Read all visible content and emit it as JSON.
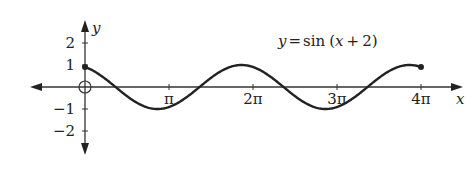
{
  "chart_data": {
    "type": "line",
    "title": "",
    "function_label": "y = sin (x + 2)",
    "function_label_parts": {
      "y": "y",
      "eq": "=",
      "fn": "sin",
      "arg_open": "(",
      "x": "x",
      "plus": "+",
      "c": "2",
      "arg_close": ")"
    },
    "xlabel": "x",
    "ylabel": "y",
    "xlim": [
      0,
      12.566
    ],
    "ylim": [
      -2,
      2
    ],
    "x_ticks": [
      {
        "value": 3.1416,
        "label": "π"
      },
      {
        "value": 6.2832,
        "label": "2π"
      },
      {
        "value": 9.4248,
        "label": "3π"
      },
      {
        "value": 12.5664,
        "label": "4π"
      }
    ],
    "y_ticks": [
      {
        "value": 2,
        "label": "2"
      },
      {
        "value": 1,
        "label": "1"
      },
      {
        "value": -1,
        "label": "−1"
      },
      {
        "value": -2,
        "label": "−2"
      }
    ],
    "series": [
      {
        "name": "y = sin(x+2)",
        "domain": [
          0,
          12.566
        ],
        "start_point": {
          "x": 0,
          "y": 0.909,
          "filled": true
        },
        "end_point": {
          "x": 12.566,
          "y": 0.909,
          "filled": true
        },
        "x": [
          0,
          1.0,
          2.0,
          3.0,
          4.0,
          5.0,
          6.0,
          7.0,
          8.0,
          9.0,
          10.0,
          11.0,
          12.0,
          12.566
        ],
        "values": [
          0.909,
          0.141,
          -0.757,
          -0.959,
          -0.279,
          0.657,
          0.989,
          0.412,
          -0.544,
          -1.0,
          -0.537,
          0.42,
          0.991,
          0.909
        ]
      }
    ],
    "origin_marker": "open-circle",
    "grid": false,
    "legend": "none"
  },
  "colors": {
    "curve": "#222222",
    "axes": "#333333"
  }
}
